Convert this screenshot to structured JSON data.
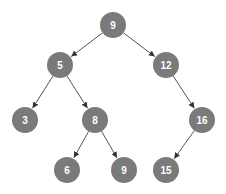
{
  "diagram": {
    "type": "binary-tree",
    "node_color": "#7a7a7a",
    "label_color": "#ffffff",
    "edge_color": "#555555",
    "nodes": [
      {
        "id": "n0",
        "label": "9",
        "level": 0,
        "parent": null,
        "side": null
      },
      {
        "id": "n1",
        "label": "5",
        "level": 1,
        "parent": "n0",
        "side": "left"
      },
      {
        "id": "n2",
        "label": "12",
        "level": 1,
        "parent": "n0",
        "side": "right"
      },
      {
        "id": "n3",
        "label": "3",
        "level": 2,
        "parent": "n1",
        "side": "left"
      },
      {
        "id": "n4",
        "label": "8",
        "level": 2,
        "parent": "n1",
        "side": "right"
      },
      {
        "id": "n5",
        "label": "16",
        "level": 2,
        "parent": "n2",
        "side": "right"
      },
      {
        "id": "n6",
        "label": "6",
        "level": 3,
        "parent": "n4",
        "side": "left"
      },
      {
        "id": "n7",
        "label": "9",
        "level": 3,
        "parent": "n4",
        "side": "right"
      },
      {
        "id": "n8",
        "label": "15",
        "level": 3,
        "parent": "n5",
        "side": "left"
      }
    ]
  }
}
